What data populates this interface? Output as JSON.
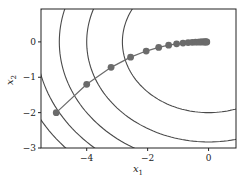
{
  "chart_data": {
    "type": "line",
    "title": "",
    "xlabel": "x1",
    "ylabel": "x2",
    "xlim": [
      -5.5,
      0.9
    ],
    "ylim": [
      -3.0,
      0.93
    ],
    "xticks": [
      -4,
      -2,
      0
    ],
    "xtick_labels": [
      "−4",
      "−2",
      "0"
    ],
    "yticks": [
      -3,
      -2,
      -1,
      0
    ],
    "ytick_labels": [
      "−3",
      "−2",
      "−1",
      "0"
    ],
    "grid": false,
    "legend": null,
    "contour": {
      "function": "x1^2 + 2*x2^2",
      "levels": [
        8,
        16,
        24,
        32,
        40
      ],
      "color": "#4a4a4a"
    },
    "series": [
      {
        "name": "gradient descent trajectory",
        "color": "#6b6b6b",
        "marker": "o",
        "x": [
          -5.0,
          -4.0,
          -3.2,
          -2.56,
          -2.048,
          -1.638,
          -1.311,
          -1.049,
          -0.839,
          -0.671,
          -0.537,
          -0.429,
          -0.344,
          -0.275,
          -0.22,
          -0.176,
          -0.141,
          -0.113,
          -0.09,
          -0.072,
          -0.058
        ],
        "y": [
          -2.0,
          -1.2,
          -0.72,
          -0.432,
          -0.259,
          -0.156,
          -0.093,
          -0.056,
          -0.034,
          -0.02,
          -0.012,
          -0.007,
          -0.004,
          -0.003,
          -0.002,
          -0.001,
          0.0,
          0.0,
          0.0,
          0.0,
          0.0
        ]
      }
    ]
  },
  "plot_box": {
    "left": 41,
    "top": 9,
    "right": 236,
    "bottom": 148
  }
}
